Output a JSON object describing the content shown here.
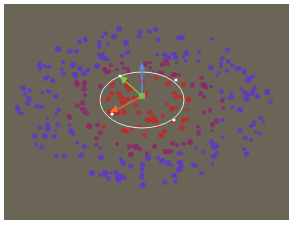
{
  "viewport": {
    "background": "#6b6558",
    "colors": {
      "inner": "#c22a2a",
      "mid": "#8a2a6a",
      "outer": "#6238c4"
    },
    "center": [
      138,
      92
    ],
    "gizmo": {
      "ellipse": {
        "cx": 138,
        "cy": 96,
        "rx": 42,
        "ry": 28,
        "stroke": "#e8e4dc"
      },
      "handles": [
        [
          116,
          72
        ],
        [
          172,
          76
        ],
        [
          108,
          110
        ],
        [
          170,
          116
        ]
      ],
      "axis_y_color": "#5a8ae8",
      "axis_x_color": "#ff6a2a",
      "axis_z_color": "#7ad040"
    }
  },
  "caption": ""
}
